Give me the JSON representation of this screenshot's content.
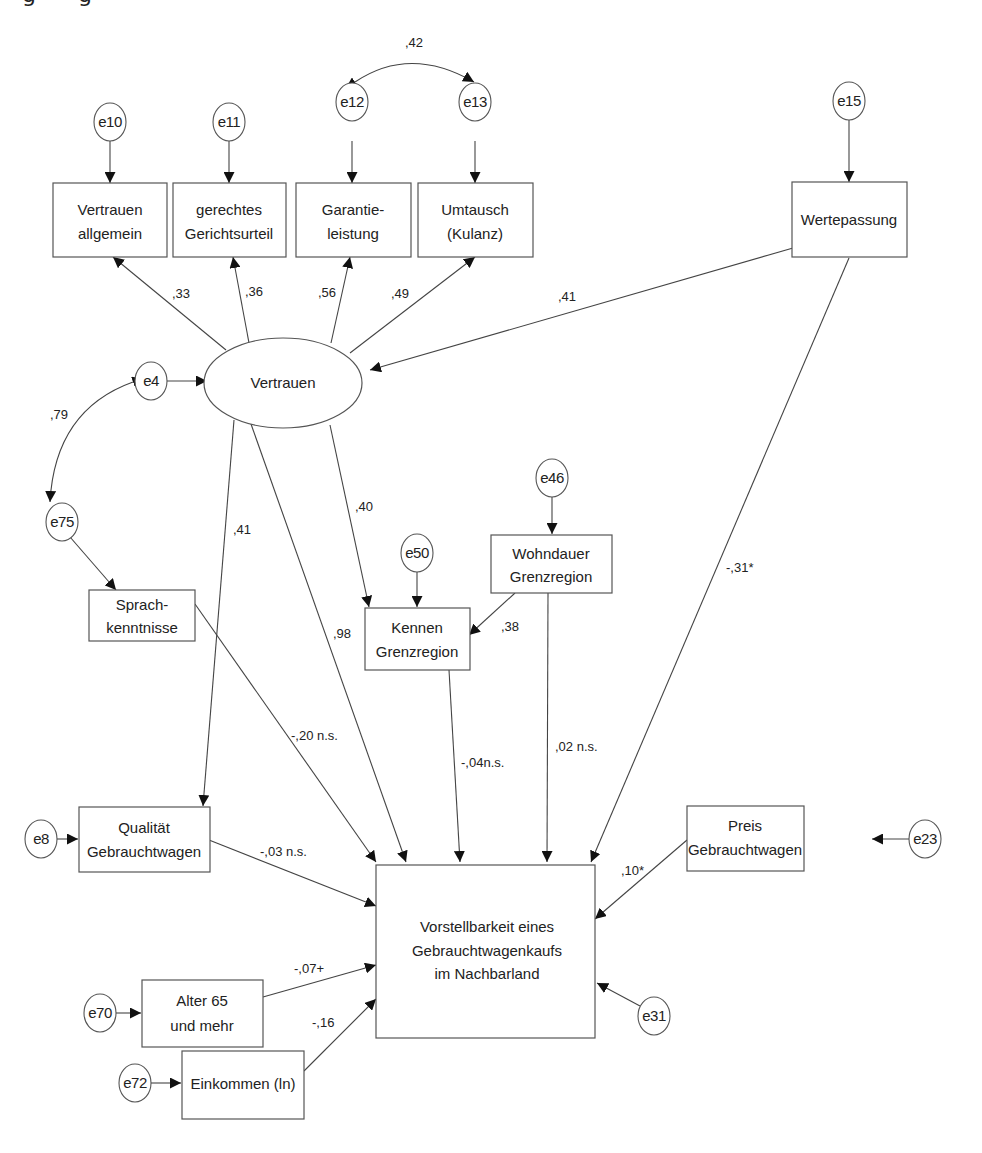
{
  "diagram": {
    "type": "structural-equation-model",
    "colors": {
      "line": "#444444",
      "box_border": "#555555",
      "text": "#222222",
      "background": "#ffffff"
    },
    "latent": {
      "id": "vertrauen",
      "label": "Vertrauen"
    },
    "indicators": [
      {
        "id": "vertrauen_allgemein",
        "lines": [
          "Vertrauen",
          "allgemein"
        ],
        "error": "e10",
        "loading": ",33"
      },
      {
        "id": "gerechtes_gerichtsurteil",
        "lines": [
          "gerechtes",
          "Gerichtsurteil"
        ],
        "error": "e11",
        "loading": ",36"
      },
      {
        "id": "garantieleistung",
        "lines": [
          "Garantie-",
          "leistung"
        ],
        "error": "e12",
        "loading": ",56"
      },
      {
        "id": "umtausch",
        "lines": [
          "Umtausch",
          "(Kulanz)"
        ],
        "error": "e13",
        "loading": ",49"
      }
    ],
    "wertepassung": {
      "lines": [
        "Wertepassung"
      ],
      "error": "e15",
      "to_vertrauen": ",41",
      "to_outcome": "-,31*"
    },
    "covariances": [
      {
        "from": "e12",
        "to": "e13",
        "value": ",42"
      },
      {
        "from": "e4",
        "to": "e75",
        "value": ",79"
      }
    ],
    "e4": "e4",
    "sprachkenntnisse": {
      "lines": [
        "Sprach-",
        "kenntnisse"
      ],
      "error": "e75",
      "to_outcome": "-,20 n.s."
    },
    "kennen": {
      "lines": [
        "Kennen",
        "Grenzregion"
      ],
      "error": "e50",
      "from_vertrauen": ",40",
      "from_wohndauer": ",38",
      "to_outcome": "-,04n.s."
    },
    "wohndauer": {
      "lines": [
        "Wohndauer",
        "Grenzregion"
      ],
      "error": "e46",
      "to_outcome": ",02 n.s."
    },
    "qualitaet": {
      "lines": [
        "Qualität",
        "Gebrauchtwagen"
      ],
      "error": "e8",
      "from_vertrauen": ",41",
      "to_outcome": "-,03 n.s."
    },
    "vertrauen_to_outcome": ",98",
    "preis": {
      "lines": [
        "Preis",
        "Gebrauchtwagen"
      ],
      "error": "e23",
      "to_outcome": ",10*"
    },
    "alter": {
      "lines": [
        "Alter 65",
        "und mehr"
      ],
      "error": "e70",
      "to_outcome": "-,07+"
    },
    "einkommen": {
      "lines": [
        "Einkommen (ln)"
      ],
      "error": "e72",
      "to_outcome": "-,16"
    },
    "outcome": {
      "lines": [
        "Vorstellbarkeit eines",
        "Gebrauchtwagenkaufs",
        "im Nachbarland"
      ],
      "error": "e31"
    }
  }
}
